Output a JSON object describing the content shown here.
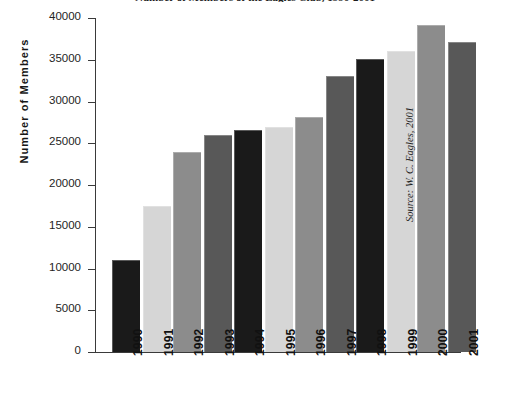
{
  "chart_data": {
    "type": "bar",
    "title": "Number of Members of the Eagles Club, 1990-2001",
    "xlabel": "",
    "ylabel": "Number of Members",
    "categories": [
      "1990",
      "1991",
      "1992",
      "1993",
      "1994",
      "1995",
      "1996",
      "1997",
      "1998",
      "1999",
      "2000",
      "2001"
    ],
    "values": [
      11000,
      17500,
      24000,
      26000,
      26600,
      27000,
      28100,
      33000,
      35100,
      36100,
      39200,
      37100
    ],
    "ylim": [
      0,
      40000
    ],
    "ytick_labels": [
      "40000",
      "35000",
      "30000",
      "25000",
      "20000",
      "15000",
      "10000",
      "5000",
      "0"
    ],
    "ytick_values": [
      40000,
      35000,
      30000,
      25000,
      20000,
      15000,
      10000,
      5000,
      0
    ],
    "grid": false,
    "legend": "none",
    "bar_colors": [
      "#1a1a1a",
      "#d6d6d6",
      "#8c8c8c",
      "#585858"
    ],
    "annotations": [
      {
        "text": "Source: W. C. Eagles, 2001",
        "position": "right-side-vertical"
      }
    ]
  },
  "axis": {
    "y_title": "Number of Members"
  },
  "source": {
    "text": "Source: W. C. Eagles, 2001"
  },
  "colors": {
    "axis": "#3a3a3a",
    "text": "#1d1d1d",
    "background": "#ffffff"
  }
}
